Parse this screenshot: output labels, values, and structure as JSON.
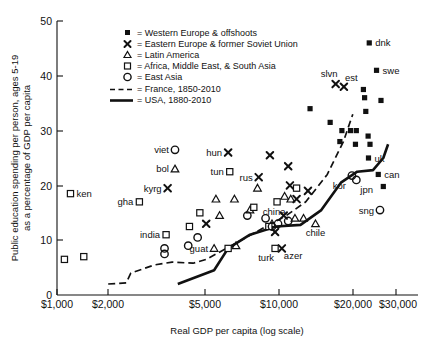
{
  "chart_data": {
    "type": "scatter",
    "title": "",
    "xlabel": "Real GDP per capita (log scale)",
    "ylabel": "Public education spending per person, ages 5-19 as a percentage of GDP per capita",
    "xscale": "log",
    "xlim": [
      1000,
      34000
    ],
    "ylim": [
      0,
      50
    ],
    "xticks": [
      1000,
      2000,
      5000,
      10000,
      20000,
      30000
    ],
    "xticklabels": [
      "$1,000",
      "$2,000",
      "$5,000",
      "$10,000",
      "$20,000",
      "$30,000"
    ],
    "yticks": [
      0,
      10,
      20,
      30,
      40,
      50
    ],
    "yticklabels": [
      "0",
      "10",
      "20",
      "30",
      "40",
      "50"
    ],
    "grid": false,
    "legend_position": "top-center",
    "legend": [
      {
        "marker": "filled-square",
        "label": "= Western Europe & offshoots"
      },
      {
        "marker": "x",
        "label": "= Eastern Europe & former Soviet Union"
      },
      {
        "marker": "triangle",
        "label": "= Latin America"
      },
      {
        "marker": "open-square",
        "label": "= Africa, Middle East, & South Asia"
      },
      {
        "marker": "circle",
        "label": "= East Asia"
      },
      {
        "marker": "dashed-line",
        "label": "= France, 1850-2010"
      },
      {
        "marker": "solid-line",
        "label": "= USA, 1880-2010"
      }
    ],
    "series": [
      {
        "name": "Western Europe & offshoots",
        "marker": "filled-square",
        "points": [
          {
            "x": 25500,
            "y": 46.0,
            "label": "dnk"
          },
          {
            "x": 27500,
            "y": 41.0,
            "label": "swe"
          },
          {
            "x": 24000,
            "y": 37.5,
            "label": ""
          },
          {
            "x": 24300,
            "y": 36.0,
            "label": ""
          },
          {
            "x": 28800,
            "y": 35.5,
            "label": ""
          },
          {
            "x": 24600,
            "y": 33.5,
            "label": ""
          },
          {
            "x": 13800,
            "y": 34.0,
            "label": ""
          },
          {
            "x": 17000,
            "y": 31.5,
            "label": ""
          },
          {
            "x": 19200,
            "y": 30.0,
            "label": ""
          },
          {
            "x": 21000,
            "y": 30.0,
            "label": ""
          },
          {
            "x": 22300,
            "y": 30.0,
            "label": ""
          },
          {
            "x": 18800,
            "y": 28.0,
            "label": ""
          },
          {
            "x": 22100,
            "y": 27.5,
            "label": ""
          },
          {
            "x": 25200,
            "y": 29.0,
            "label": ""
          },
          {
            "x": 25700,
            "y": 27.5,
            "label": ""
          },
          {
            "x": 25300,
            "y": 25.0,
            "label": "uk"
          },
          {
            "x": 28000,
            "y": 22.0,
            "label": "can"
          },
          {
            "x": 29500,
            "y": 19.8,
            "label": ""
          }
        ]
      },
      {
        "name": "Eastern Europe & former Soviet Union",
        "marker": "x",
        "points": [
          {
            "x": 18000,
            "y": 38.5,
            "label": "slvn"
          },
          {
            "x": 19600,
            "y": 38.0,
            "label": "est"
          },
          {
            "x": 5900,
            "y": 26.0,
            "label": "hun"
          },
          {
            "x": 9100,
            "y": 25.5,
            "label": ""
          },
          {
            "x": 11000,
            "y": 23.5,
            "label": ""
          },
          {
            "x": 8100,
            "y": 21.5,
            "label": "rus"
          },
          {
            "x": 11200,
            "y": 20.0,
            "label": ""
          },
          {
            "x": 13500,
            "y": 19.0,
            "label": ""
          },
          {
            "x": 3150,
            "y": 19.5,
            "label": "kyrg"
          },
          {
            "x": 12000,
            "y": 17.5,
            "label": ""
          },
          {
            "x": 10500,
            "y": 14.5,
            "label": ""
          },
          {
            "x": 4700,
            "y": 13.0,
            "label": ""
          },
          {
            "x": 9600,
            "y": 11.5,
            "label": ""
          },
          {
            "x": 10300,
            "y": 8.5,
            "label": "azer"
          }
        ]
      },
      {
        "name": "Latin America",
        "marker": "triangle",
        "points": [
          {
            "x": 3400,
            "y": 23.0,
            "label": "bol"
          },
          {
            "x": 8000,
            "y": 19.5,
            "label": ""
          },
          {
            "x": 10600,
            "y": 18.0,
            "label": ""
          },
          {
            "x": 11300,
            "y": 17.5,
            "label": ""
          },
          {
            "x": 6300,
            "y": 17.5,
            "label": ""
          },
          {
            "x": 5200,
            "y": 17.5,
            "label": ""
          },
          {
            "x": 7400,
            "y": 15.5,
            "label": ""
          },
          {
            "x": 5400,
            "y": 14.5,
            "label": ""
          },
          {
            "x": 11800,
            "y": 14.0,
            "label": ""
          },
          {
            "x": 12900,
            "y": 14.0,
            "label": ""
          },
          {
            "x": 9300,
            "y": 13.0,
            "label": ""
          },
          {
            "x": 14600,
            "y": 13.0,
            "label": "chile"
          },
          {
            "x": 6400,
            "y": 9.0,
            "label": ""
          },
          {
            "x": 5100,
            "y": 8.5,
            "label": "guat"
          }
        ]
      },
      {
        "name": "Africa, Middle East, & South Asia",
        "marker": "open-square",
        "points": [
          {
            "x": 1150,
            "y": 18.5,
            "label": "ken"
          },
          {
            "x": 6000,
            "y": 22.5,
            "label": "tun"
          },
          {
            "x": 2350,
            "y": 17.0,
            "label": "gha"
          },
          {
            "x": 12000,
            "y": 19.5,
            "label": ""
          },
          {
            "x": 9800,
            "y": 17.0,
            "label": ""
          },
          {
            "x": 7700,
            "y": 16.0,
            "label": ""
          },
          {
            "x": 4400,
            "y": 15.0,
            "label": ""
          },
          {
            "x": 3950,
            "y": 12.5,
            "label": ""
          },
          {
            "x": 9000,
            "y": 12.5,
            "label": ""
          },
          {
            "x": 3100,
            "y": 11.0,
            "label": "india"
          },
          {
            "x": 1080,
            "y": 6.5,
            "label": ""
          },
          {
            "x": 1320,
            "y": 7.0,
            "label": ""
          },
          {
            "x": 5900,
            "y": 8.5,
            "label": ""
          },
          {
            "x": 9600,
            "y": 8.5,
            "label": "turk"
          }
        ]
      },
      {
        "name": "East Asia",
        "marker": "circle",
        "points": [
          {
            "x": 3400,
            "y": 26.5,
            "label": "viet"
          },
          {
            "x": 21300,
            "y": 21.8,
            "label": "kor"
          },
          {
            "x": 22300,
            "y": 21.0,
            "label": "jpn"
          },
          {
            "x": 28500,
            "y": 15.5,
            "label": "sng"
          },
          {
            "x": 7200,
            "y": 14.5,
            "label": ""
          },
          {
            "x": 8700,
            "y": 14.0,
            "label": ""
          },
          {
            "x": 9900,
            "y": 13.0,
            "label": ""
          },
          {
            "x": 11000,
            "y": 13.5,
            "label": "china"
          },
          {
            "x": 9300,
            "y": 12.5,
            "label": ""
          },
          {
            "x": 4300,
            "y": 10.5,
            "label": ""
          },
          {
            "x": 3900,
            "y": 9.0,
            "label": ""
          },
          {
            "x": 3050,
            "y": 8.5,
            "label": ""
          },
          {
            "x": 3050,
            "y": 7.5,
            "label": ""
          }
        ]
      }
    ],
    "lines": [
      {
        "name": "France, 1850-2010",
        "style": "dashed",
        "points": [
          {
            "x": 1700,
            "y": 2.0
          },
          {
            "x": 2050,
            "y": 2.2
          },
          {
            "x": 2150,
            "y": 4.0
          },
          {
            "x": 2750,
            "y": 5.5
          },
          {
            "x": 3300,
            "y": 6.0
          },
          {
            "x": 4100,
            "y": 5.8
          },
          {
            "x": 4700,
            "y": 6.5
          },
          {
            "x": 6100,
            "y": 9.0
          },
          {
            "x": 8300,
            "y": 12.0
          },
          {
            "x": 10800,
            "y": 14.5
          },
          {
            "x": 13200,
            "y": 17.0
          },
          {
            "x": 16500,
            "y": 22.0
          },
          {
            "x": 19500,
            "y": 28.0
          },
          {
            "x": 21500,
            "y": 33.0
          }
        ]
      },
      {
        "name": "USA, 1880-2010",
        "style": "solid",
        "points": [
          {
            "x": 3500,
            "y": 2.0
          },
          {
            "x": 5100,
            "y": 4.5
          },
          {
            "x": 5900,
            "y": 8.5
          },
          {
            "x": 7400,
            "y": 11.0
          },
          {
            "x": 9700,
            "y": 12.5
          },
          {
            "x": 12500,
            "y": 12.8
          },
          {
            "x": 15500,
            "y": 15.5
          },
          {
            "x": 19000,
            "y": 20.5
          },
          {
            "x": 22500,
            "y": 22.5
          },
          {
            "x": 26500,
            "y": 22.8
          },
          {
            "x": 29500,
            "y": 25.0
          },
          {
            "x": 31000,
            "y": 27.5
          }
        ]
      }
    ]
  },
  "axis": {
    "ylabel": "Public education spending per person, ages 5-19\nas a percentage of GDP per capita",
    "ylabel_line1": "Public education spending per person, ages 5-19",
    "ylabel_line2": "as a percentage of GDP per capita",
    "xlabel": "Real GDP per capita (log scale)",
    "ytick_0": "0",
    "ytick_10": "10",
    "ytick_20": "20",
    "ytick_30": "30",
    "ytick_40": "40",
    "ytick_50": "50",
    "xtick_1000": "$1,000",
    "xtick_2000": "$2,000",
    "xtick_5000": "$5,000",
    "xtick_10000": "$10,000",
    "xtick_20000": "$20,000",
    "xtick_30000": "$30,000"
  },
  "legend": {
    "item0": "= Western Europe & offshoots",
    "item1": "= Eastern Europe & former Soviet Union",
    "item2": "= Latin America",
    "item3": "= Africa, Middle East, & South Asia",
    "item4": "= East Asia",
    "item5": "= France, 1850-2010",
    "item6": "= USA, 1880-2010"
  }
}
